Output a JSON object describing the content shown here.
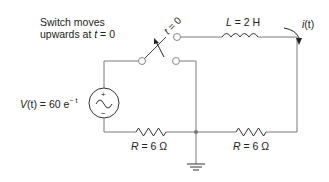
{
  "diagram": {
    "type": "circuit-schematic",
    "switch_note_line1": "Switch moves",
    "switch_note_line2": "upwards at ",
    "switch_note_t": "t",
    "switch_note_eq": " = 0",
    "switch_label_t": "t",
    "switch_label_eq": " = 0",
    "inductor_label_sym": "L",
    "inductor_label_val": " = 2 H",
    "current_label_sym": "i",
    "current_label_arg": "(t)",
    "source_label_sym": "V",
    "source_label_arg": "(t)",
    "source_label_eq": " = 60 e",
    "source_label_exp": "− t",
    "source_plus": "+",
    "source_minus": "−",
    "resistor1_label_sym": "R",
    "resistor1_label_val": " = 6 Ω",
    "resistor2_label_sym": "R",
    "resistor2_label_val": " = 6 Ω"
  },
  "colors": {
    "wire": "#7a7a7a",
    "component": "#333333",
    "text": "#222222"
  }
}
